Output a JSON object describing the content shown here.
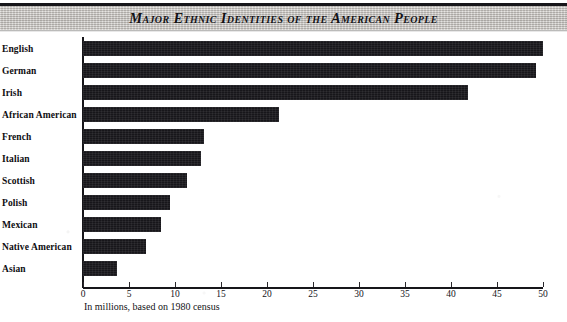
{
  "banner": {
    "title": "Major Ethnic Identities of the American People"
  },
  "chart_data": {
    "type": "bar",
    "orientation": "horizontal",
    "title": "Major Ethnic Identities of the American People",
    "subtitle": "",
    "xlabel": "In millions, based on 1980 census",
    "ylabel": "",
    "categories": [
      "English",
      "German",
      "Irish",
      "African American",
      "French",
      "Italian",
      "Scottish",
      "Polish",
      "Mexican",
      "Native American",
      "Asian"
    ],
    "values": [
      50.0,
      49.2,
      41.8,
      21.3,
      13.1,
      12.8,
      11.3,
      9.5,
      8.5,
      6.8,
      3.7
    ],
    "xlim": [
      0,
      50
    ],
    "xticks": [
      0,
      5,
      10,
      15,
      20,
      25,
      30,
      35,
      40,
      45,
      50
    ],
    "xtick_labels": [
      "0",
      "5",
      "10",
      "15",
      "20",
      "25",
      "30",
      "35",
      "40",
      "45",
      "50"
    ],
    "grid": false,
    "legend": false,
    "bar_color": "#17161a",
    "background_color": "#ffffff",
    "units": "millions"
  },
  "caption": {
    "text": "In millions, based on 1980 census"
  },
  "colors": {
    "bar": "#17161a",
    "axis": "#17161a",
    "banner_fill": "#d0cdc9",
    "text": "#111111"
  }
}
